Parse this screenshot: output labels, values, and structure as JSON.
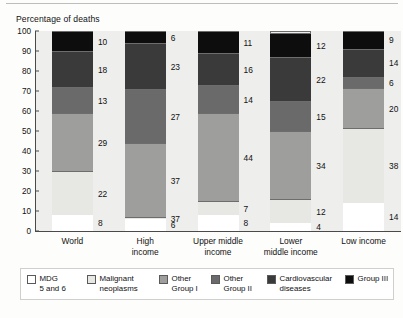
{
  "header": {
    "axis_title": "Percentage of deaths"
  },
  "chart_data": {
    "type": "bar",
    "subtype": "stacked-vertical-100",
    "title": "",
    "subtitle": "",
    "xlabel": "",
    "ylabel": "Percentage of deaths",
    "ylim": [
      0,
      100
    ],
    "yticks": [
      0,
      10,
      20,
      30,
      40,
      50,
      60,
      70,
      80,
      90,
      100
    ],
    "ytick_labels": [
      "0",
      "10",
      "20",
      "30",
      "40",
      "50",
      "60",
      "70",
      "80",
      "90",
      "100"
    ],
    "grid": false,
    "legend_position": "bottom",
    "categories": [
      "World",
      "High income",
      "Upper middle income",
      "Lower middle income",
      "Low income"
    ],
    "category_lines": [
      [
        "World"
      ],
      [
        "High",
        "income"
      ],
      [
        "Upper middle",
        "income"
      ],
      [
        "Lower",
        "middle income"
      ],
      [
        "Low income"
      ]
    ],
    "series": [
      {
        "name": "MDG 5 and 6",
        "color": "#ffffff",
        "values": [
          8,
          6,
          8,
          4,
          14
        ]
      },
      {
        "name": "Malignant neoplasms",
        "color": "#e7e7e3",
        "values": [
          22,
          37,
          7,
          12,
          38
        ]
      },
      {
        "name": "Other Group I",
        "color": "#9e9e9c",
        "values": [
          29,
          37,
          44,
          34,
          20
        ]
      },
      {
        "name": "Other Group II",
        "color": "#6a6a6a",
        "values": [
          13,
          27,
          14,
          15,
          6
        ]
      },
      {
        "name": "Cardiovascular diseases",
        "color": "#3a3a3a",
        "values": [
          18,
          23,
          16,
          22,
          14
        ]
      },
      {
        "name": "Group III",
        "color": "#0d0d0d",
        "values": [
          10,
          6,
          11,
          12,
          9
        ]
      }
    ],
    "bar_stacks": [
      {
        "category": "World",
        "segments": [
          {
            "label": "MDG 5 and 6",
            "value": 8,
            "color": "#ffffff"
          },
          {
            "label": "Malignant neoplasms",
            "value": 22,
            "color": "#e7e7e3"
          },
          {
            "label": "Other Group I",
            "value": 29,
            "color": "#9e9e9c"
          },
          {
            "label": "Other Group II",
            "value": 13,
            "color": "#6a6a6a"
          },
          {
            "label": "Cardiovascular diseases",
            "value": 18,
            "color": "#3a3a3a"
          },
          {
            "label": "Group III",
            "value": 10,
            "color": "#0d0d0d"
          }
        ]
      },
      {
        "category": "High income",
        "segments": [
          {
            "label": "MDG 5 and 6",
            "value": 6,
            "color": "#ffffff"
          },
          {
            "label": "Malignant neoplasms",
            "value": 1,
            "color": "#e7e7e3"
          },
          {
            "label": "Other Group I",
            "value": 37,
            "color": "#9e9e9c"
          },
          {
            "label": "Other Group II",
            "value": 27,
            "color": "#6a6a6a"
          },
          {
            "label": "Cardiovascular diseases",
            "value": 23,
            "color": "#3a3a3a"
          },
          {
            "label": "Group III",
            "value": 6,
            "color": "#0d0d0d"
          }
        ]
      },
      {
        "category": "Upper middle income",
        "segments": [
          {
            "label": "MDG 5 and 6",
            "value": 8,
            "color": "#ffffff"
          },
          {
            "label": "Malignant neoplasms",
            "value": 7,
            "color": "#e7e7e3"
          },
          {
            "label": "Other Group I",
            "value": 44,
            "color": "#9e9e9c"
          },
          {
            "label": "Other Group II",
            "value": 14,
            "color": "#6a6a6a"
          },
          {
            "label": "Cardiovascular diseases",
            "value": 16,
            "color": "#3a3a3a"
          },
          {
            "label": "Group III",
            "value": 11,
            "color": "#0d0d0d"
          }
        ]
      },
      {
        "category": "Lower middle income",
        "segments": [
          {
            "label": "MDG 5 and 6",
            "value": 4,
            "color": "#ffffff"
          },
          {
            "label": "Malignant neoplasms",
            "value": 12,
            "color": "#e7e7e3"
          },
          {
            "label": "Other Group I",
            "value": 34,
            "color": "#9e9e9c"
          },
          {
            "label": "Other Group II",
            "value": 15,
            "color": "#6a6a6a"
          },
          {
            "label": "Cardiovascular diseases",
            "value": 22,
            "color": "#3a3a3a"
          },
          {
            "label": "Group III",
            "value": 12,
            "color": "#0d0d0d"
          }
        ]
      },
      {
        "category": "Low income",
        "segments": [
          {
            "label": "MDG 5 and 6",
            "value": 14,
            "color": "#ffffff"
          },
          {
            "label": "Malignant neoplasms",
            "value": 38,
            "color": "#e7e7e3"
          },
          {
            "label": "Other Group I",
            "value": 20,
            "color": "#9e9e9c"
          },
          {
            "label": "Other Group II",
            "value": 6,
            "color": "#6a6a6a"
          },
          {
            "label": "Cardiovascular diseases",
            "value": 14,
            "color": "#3a3a3a"
          },
          {
            "label": "Group III",
            "value": 9,
            "color": "#0d0d0d"
          }
        ]
      }
    ],
    "legend": [
      {
        "label": "MDG\n5 and 6",
        "color": "#ffffff"
      },
      {
        "label": "Malignant\nneoplasms",
        "color": "#e7e7e3"
      },
      {
        "label": "Other\nGroup I",
        "color": "#9e9e9c"
      },
      {
        "label": "Other\nGroup II",
        "color": "#6a6a6a"
      },
      {
        "label": "Cardiovascular\ndiseases",
        "color": "#3a3a3a"
      },
      {
        "label": "Group III",
        "color": "#0d0d0d"
      }
    ]
  }
}
